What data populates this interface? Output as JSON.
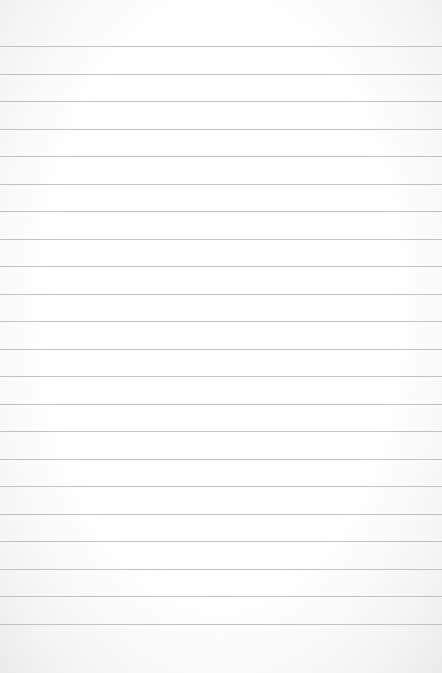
{
  "paper": {
    "type": "lined-paper",
    "line_count": 22,
    "first_line_y": 46,
    "line_spacing": 27.5,
    "line_color": "#b9b9b9",
    "background_color": "#ffffff"
  }
}
